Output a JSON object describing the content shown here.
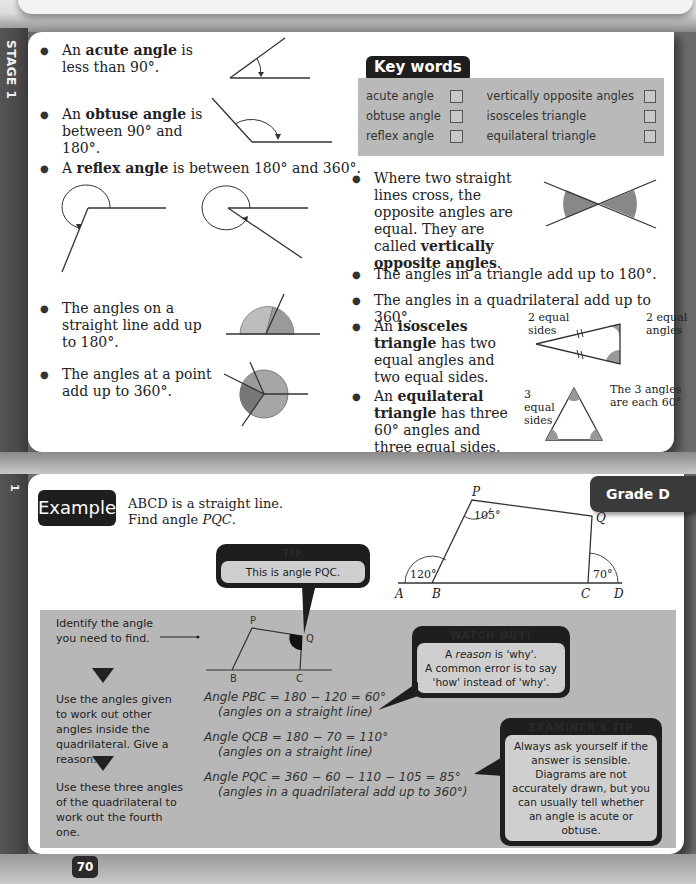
{
  "side": {
    "stage_label": "STAGE 1",
    "section_number": "1"
  },
  "top_section": {
    "bullets": [
      {
        "prefix": "An ",
        "term": "acute angle",
        "suffix": " is less than 90°."
      },
      {
        "prefix": "An ",
        "term": "obtuse angle",
        "suffix": " is between 90° and 180°."
      },
      {
        "prefix": "A ",
        "term": "reflex angle",
        "suffix": " is between 180° and 360°."
      },
      {
        "text": "The angles on a straight line add up to 180°."
      },
      {
        "text": "The angles at a point add up to 360°."
      },
      {
        "text_before": "Where two straight lines cross, the opposite angles are equal. They are called ",
        "term": "vertically opposite angles",
        "text_after": "."
      },
      {
        "text": "The angles in a triangle add up to 180°."
      },
      {
        "text": "The angles in a quadrilateral add up to 360°."
      },
      {
        "prefix": "An ",
        "term": "isosceles triangle",
        "suffix": " has two equal angles and two equal sides."
      },
      {
        "prefix": "An ",
        "term": "equilateral triangle",
        "suffix": " has three 60° angles and three equal sides."
      }
    ],
    "isosceles_annotations": {
      "sides": "2 equal sides",
      "angles": "2 equal angles"
    },
    "equilateral_annotations": {
      "sides": "3 equal sides",
      "angles": "The 3 angles are each 60°"
    }
  },
  "key_words": {
    "title": "Key words",
    "items": [
      {
        "label": "acute angle",
        "checked": false
      },
      {
        "label": "obtuse angle",
        "checked": false
      },
      {
        "label": "reflex angle",
        "checked": false
      },
      {
        "label": "vertically opposite angles",
        "checked": false
      },
      {
        "label": "isosceles triangle",
        "checked": false
      },
      {
        "label": "equilateral triangle",
        "checked": false
      }
    ]
  },
  "example": {
    "badge": "Example",
    "grade": "Grade D",
    "question_line1": "ABCD is a straight line.",
    "question_line2_prefix": "Find angle ",
    "question_line2_var": "PQC",
    "question_line2_suffix": ".",
    "diagram": {
      "points": [
        "P",
        "Q",
        "A",
        "B",
        "C",
        "D"
      ],
      "angle_P": "105°",
      "angle_ext_B": "120°",
      "angle_ext_C": "70°"
    },
    "tip": {
      "title": "TIP",
      "body": "This is angle PQC."
    },
    "steps": [
      "Identify the angle you need to find.",
      "Use the angles given to work out other angles inside the quadrilateral. Give a reason.",
      "Use these three angles of the quadrilateral to work out the fourth one."
    ],
    "small_diagram_labels": [
      "P",
      "Q",
      "B",
      "C"
    ],
    "calculations": [
      {
        "line": "Angle PBC = 180 − 120 = 60°",
        "reason": "(angles on a straight line)"
      },
      {
        "line": "Angle QCB = 180 − 70 = 110°",
        "reason": "(angles on a straight line)"
      },
      {
        "line": "Angle PQC = 360 − 60 − 110 − 105 = 85°",
        "reason": "(angles in a quadrilateral add up to 360°)"
      }
    ],
    "watch_out": {
      "title": "WATCH OUT!",
      "body_italic": "reason",
      "body_prefix": "A ",
      "body_line1_suffix": " is 'why'.",
      "body_line2": "A common error is to say 'how' instead of 'why'."
    },
    "examiner_tip": {
      "title": "EXAMINER'S TIP",
      "body": "Always ask yourself if the answer is sensible. Diagrams are not accurately drawn, but you can usually tell whether an angle is acute or obtuse."
    }
  },
  "page_number": "70",
  "colors": {
    "dark_badge": "#1e1e1e",
    "panel_grey": "#b7b7b7",
    "shade_light": "#b5b5b5",
    "shade_mid": "#999999",
    "shade_dark": "#777777"
  }
}
